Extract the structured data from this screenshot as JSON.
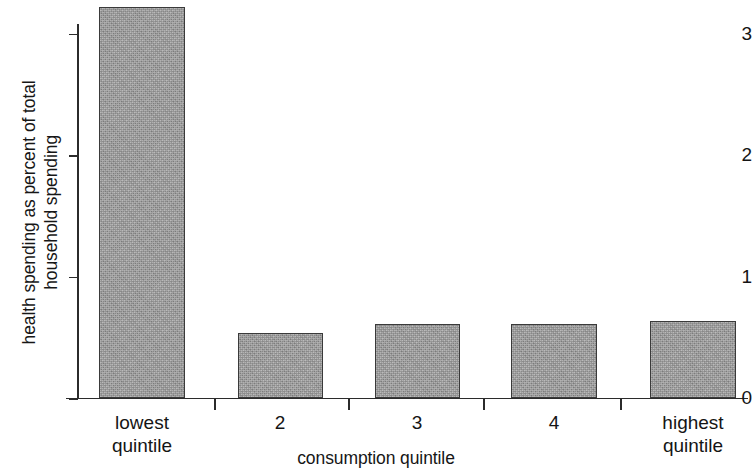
{
  "chart_data": {
    "type": "bar",
    "title": "",
    "subtitle": "",
    "xlabel": "consumption quintile",
    "ylabel": "health spending as percent of total\nhousehold spending",
    "categories": [
      "lowest\nquintile",
      "2",
      "3",
      "4",
      "highest\nquintile"
    ],
    "values": [
      3.21,
      0.53,
      0.61,
      0.61,
      0.63
    ],
    "ylim": [
      0,
      3.3
    ],
    "yticks": [
      0,
      1,
      2,
      3
    ],
    "ytick_labels": [
      "0",
      "1",
      "2",
      "3"
    ],
    "grid": false,
    "legend": null,
    "bar_color": "#9c9c9c",
    "bar_edge_color": "#3a3a3a",
    "axis_color": "#2b2b2b",
    "background": "#ffffff"
  },
  "axes": {
    "y_title": "health spending as percent of total\nhousehold spending",
    "x_title": "consumption quintile"
  }
}
